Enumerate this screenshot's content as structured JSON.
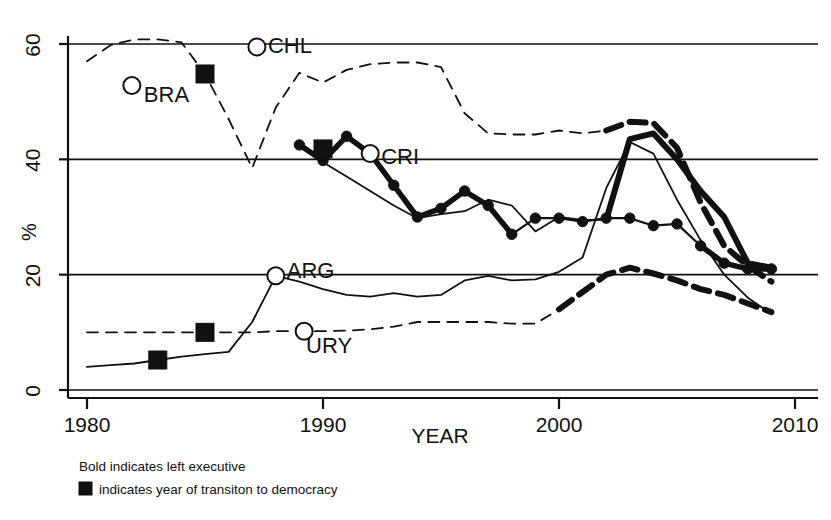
{
  "chart_data": {
    "type": "line",
    "title": "",
    "xlabel": "YEAR",
    "ylabel": "%",
    "xlim": [
      1980,
      2010
    ],
    "ylim": [
      0,
      62
    ],
    "xticks": [
      1980,
      1990,
      2000,
      2010
    ],
    "xtick_labels": [
      "1980",
      "1990",
      "2000",
      "2010"
    ],
    "yticks": [
      0,
      20,
      40,
      60
    ],
    "ytick_labels": [
      "0",
      "20",
      "40",
      "60"
    ],
    "grid": "horizontal",
    "legend_position": "below-axis",
    "annotations": [
      {
        "name": "BRA",
        "label": "BRA",
        "marker": "open-circle",
        "x": 1981.9,
        "y": 52.8,
        "label_dx": 12,
        "label_dy": 16
      },
      {
        "name": "CHL",
        "label": "CHL",
        "marker": "open-circle",
        "x": 1987.2,
        "y": 59.5,
        "label_dx": 11,
        "label_dy": 6
      },
      {
        "name": "CRI",
        "label": "CRI",
        "marker": "open-circle",
        "x": 1992.0,
        "y": 41.0,
        "label_dx": 11,
        "label_dy": 10
      },
      {
        "name": "ARG",
        "label": "ARG",
        "marker": "open-circle",
        "x": 1988.0,
        "y": 19.8,
        "label_dx": 11,
        "label_dy": 2
      },
      {
        "name": "URY",
        "label": "URY",
        "marker": "open-circle",
        "x": 1989.2,
        "y": 10.2,
        "label_dx": 2,
        "label_dy": 22
      }
    ],
    "transition_markers": [
      {
        "country": "ARG",
        "x": 1983,
        "y": 5.2
      },
      {
        "country": "URY",
        "x": 1985,
        "y": 10.0
      },
      {
        "country": "BRA",
        "x": 1985,
        "y": 54.8
      },
      {
        "country": "CHL",
        "x": 1990,
        "y": 41.8
      }
    ],
    "series": [
      {
        "name": "CHL",
        "style": "dashed",
        "markers": "none",
        "x": [
          1980,
          1981,
          1982,
          1983,
          1984,
          1985,
          1986,
          1987,
          1988,
          1989,
          1990,
          1991,
          1992,
          1993,
          1994,
          1995,
          1996,
          1997,
          1998,
          1999,
          2000,
          2001,
          2002,
          2003,
          2004,
          2005,
          2006,
          2007,
          2008,
          2009
        ],
        "y": [
          57.0,
          59.8,
          60.8,
          60.8,
          60.3,
          54.8,
          47.0,
          38.5,
          49.0,
          55.0,
          53.3,
          55.5,
          56.5,
          56.8,
          56.8,
          56.0,
          48.0,
          44.5,
          44.3,
          44.3,
          45.0,
          44.5,
          45.0,
          46.5,
          46.3,
          42.0,
          32.5,
          25.0,
          21.5,
          18.8
        ],
        "bold_from": 2002
      },
      {
        "name": "BRA",
        "style": "solid",
        "markers": "none",
        "x": [
          1981,
          1982,
          1983,
          1984,
          1985,
          1986,
          1987,
          1988,
          1989,
          1990,
          1991,
          1992,
          1993,
          1994,
          1995,
          1996,
          1997,
          1998,
          1999,
          2000,
          2001,
          2002,
          2003,
          2004,
          2005,
          2006,
          2007,
          2008,
          2009
        ],
        "y": [
          null,
          52.8,
          null,
          null,
          54.8,
          null,
          null,
          null,
          null,
          39.5,
          37.0,
          34.5,
          32.0,
          29.8,
          30.5,
          31.0,
          33.0,
          32.0,
          27.5,
          30.0,
          29.5,
          29.5,
          43.5,
          44.5,
          40.0,
          34.5,
          30.0,
          22.0,
          21.2
        ],
        "bold_from": 2002
      },
      {
        "name": "CRI",
        "style": "solid",
        "markers": "filled-circle",
        "x": [
          1989,
          1990,
          1991,
          1992,
          1993,
          1994,
          1995,
          1996,
          1997,
          1998,
          1999,
          2000,
          2001,
          2002,
          2003,
          2004,
          2005,
          2006,
          2007,
          2008,
          2009
        ],
        "y": [
          42.5,
          39.8,
          44.0,
          41.0,
          35.5,
          30.0,
          31.5,
          34.5,
          32.0,
          27.0,
          29.8,
          29.8,
          29.2,
          29.8,
          29.8,
          28.5,
          28.8,
          25.0,
          22.0,
          21.0,
          21.0
        ],
        "bold_from": 1989
      },
      {
        "name": "ARG",
        "style": "solid",
        "markers": "none",
        "x": [
          1980,
          1981,
          1982,
          1983,
          1984,
          1985,
          1986,
          1987,
          1988,
          1989,
          1990,
          1991,
          1992,
          1993,
          1994,
          1995,
          1996,
          1997,
          1998,
          1999,
          2000,
          2001,
          2002,
          2003,
          2004,
          2005,
          2006,
          2007,
          2008,
          2009
        ],
        "y": [
          4.0,
          4.3,
          4.6,
          5.2,
          5.8,
          6.2,
          6.6,
          11.8,
          19.8,
          18.8,
          17.5,
          16.5,
          16.2,
          16.8,
          16.2,
          16.5,
          19.0,
          19.8,
          19.0,
          19.2,
          20.5,
          23.0,
          35.0,
          43.0,
          41.0,
          33.0,
          26.0,
          20.0,
          16.0,
          13.2
        ],
        "bold_from": null
      },
      {
        "name": "URY",
        "style": "dashed-then-solid",
        "markers": "none",
        "x": [
          1980,
          1981,
          1982,
          1983,
          1984,
          1985,
          1986,
          1987,
          1988,
          1989,
          1990,
          1991,
          1992,
          1993,
          1994,
          1995,
          1996,
          1997,
          1998,
          1999,
          2000,
          2001,
          2002,
          2003,
          2004,
          2005,
          2006,
          2007,
          2008,
          2009
        ],
        "y": [
          10.0,
          10.0,
          10.0,
          10.0,
          10.0,
          10.0,
          10.0,
          10.0,
          10.2,
          10.2,
          10.2,
          10.3,
          10.5,
          11.0,
          11.8,
          11.8,
          11.8,
          11.8,
          11.5,
          11.5,
          14.0,
          17.0,
          20.0,
          21.2,
          20.2,
          19.0,
          17.5,
          16.5,
          15.0,
          13.5
        ],
        "bold_from": 2000
      }
    ]
  },
  "legend": {
    "line1": "Bold indicates left executive",
    "line2": "indicates year of transiton to democracy",
    "swatch": "black-square"
  }
}
